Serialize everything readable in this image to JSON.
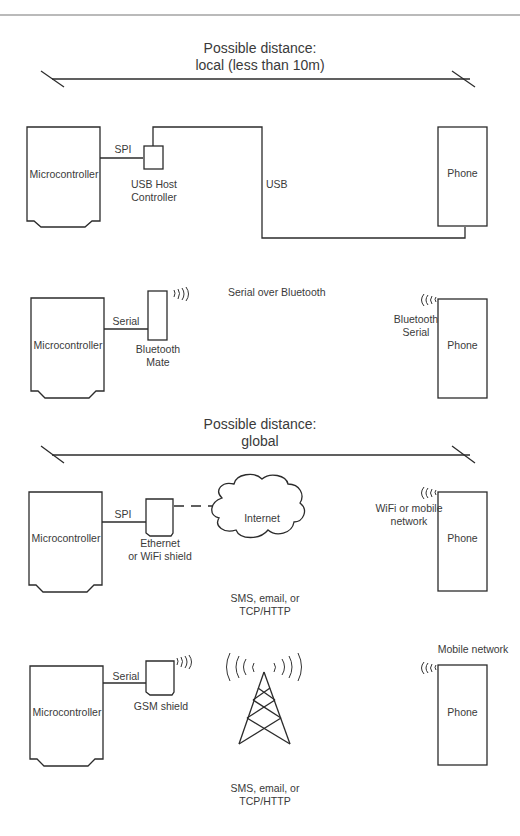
{
  "top_rule": true,
  "sections": {
    "local": {
      "distance_title": "Possible distance:",
      "distance_value": "local (less than 10m)"
    },
    "global": {
      "distance_title": "Possible distance:",
      "distance_value": "global"
    }
  },
  "scenarios": {
    "usb": {
      "microcontroller_label": "Microcontroller",
      "link_label": "SPI",
      "module_label_line1": "USB Host",
      "module_label_line2": "Controller",
      "cable_label": "USB",
      "phone_label": "Phone"
    },
    "bluetooth": {
      "microcontroller_label": "Microcontroller",
      "link_label": "Serial",
      "module_label_line1": "Bluetooth",
      "module_label_line2": "Mate",
      "channel_label": "Serial over Bluetooth",
      "phone_radio_label_line1": "Bluetooth",
      "phone_radio_label_line2": "Serial",
      "phone_label": "Phone"
    },
    "internet": {
      "microcontroller_label": "Microcontroller",
      "link_label": "SPI",
      "module_label_line1": "Ethernet",
      "module_label_line2": "or WiFi shield",
      "cloud_label": "Internet",
      "protocol_line1": "SMS, email, or",
      "protocol_line2": "TCP/HTTP",
      "phone_radio_label_line1": "WiFi or mobile",
      "phone_radio_label_line2": "network",
      "phone_label": "Phone"
    },
    "gsm": {
      "microcontroller_label": "Microcontroller",
      "link_label": "Serial",
      "module_label": "GSM shield",
      "protocol_line1": "SMS, email, or",
      "protocol_line2": "TCP/HTTP",
      "phone_radio_label": "Mobile network",
      "phone_label": "Phone"
    }
  },
  "icons": {
    "radio_waves": "radio-waves-icon",
    "cell_tower": "cell-tower-icon",
    "cloud": "cloud-icon"
  },
  "colors": {
    "line": "#2b2b2b",
    "text": "#3a3a3a",
    "background": "#ffffff"
  }
}
